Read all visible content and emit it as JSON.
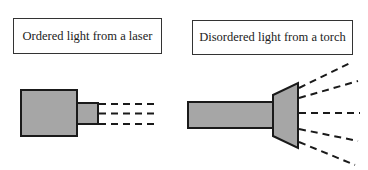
{
  "labels": {
    "laser": "Ordered light from a laser",
    "torch": "Disordered light from a torch"
  },
  "colors": {
    "fill": "#a6a6a6",
    "stroke": "#1a1a1a"
  }
}
